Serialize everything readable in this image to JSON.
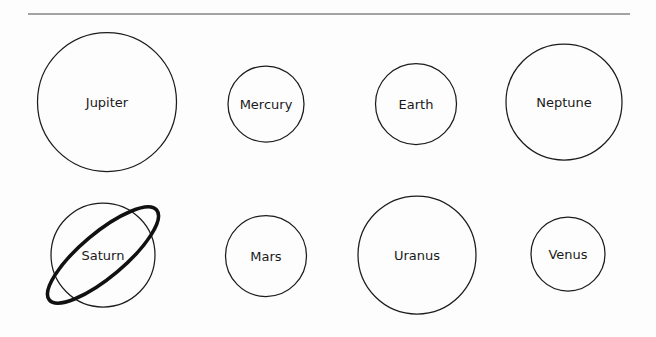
{
  "figure": {
    "title": "",
    "background_color": "#fdfdfd",
    "divider": {
      "name": "horizontal-rule",
      "x1": 28,
      "x2": 630,
      "y": 14,
      "color": "#848484",
      "thickness": 1.6
    },
    "stroke_color": "#1c1c1c",
    "label_color": "#1a1a1a",
    "ring_color": "#111111"
  },
  "chart_data": {
    "type": "scatter",
    "xlabel": "",
    "ylabel": "",
    "note": "Each planet is drawn as a circle whose diameter encodes relative size; Saturn additionally shows a ring.",
    "planets": [
      {
        "name": "Jupiter",
        "label": "Jupiter",
        "cx": 107,
        "cy": 102,
        "diameter": 139,
        "row": 1,
        "column": 1,
        "has_ring": false
      },
      {
        "name": "Mercury",
        "label": "Mercury",
        "cx": 266,
        "cy": 104,
        "diameter": 76,
        "row": 1,
        "column": 2,
        "has_ring": false
      },
      {
        "name": "Earth",
        "label": "Earth",
        "cx": 416,
        "cy": 104,
        "diameter": 81,
        "row": 1,
        "column": 3,
        "has_ring": false
      },
      {
        "name": "Neptune",
        "label": "Neptune",
        "cx": 564,
        "cy": 102,
        "diameter": 116,
        "row": 1,
        "column": 4,
        "has_ring": false
      },
      {
        "name": "Saturn",
        "label": "Saturn",
        "cx": 103,
        "cy": 255,
        "diameter": 104,
        "row": 2,
        "column": 1,
        "has_ring": true,
        "ring": {
          "rx": 70,
          "ry": 22,
          "rotation": -40
        }
      },
      {
        "name": "Mars",
        "label": "Mars",
        "cx": 266,
        "cy": 256,
        "diameter": 81,
        "row": 2,
        "column": 2,
        "has_ring": false
      },
      {
        "name": "Uranus",
        "label": "Uranus",
        "cx": 417,
        "cy": 255,
        "diameter": 118,
        "row": 2,
        "column": 3,
        "has_ring": false
      },
      {
        "name": "Venus",
        "label": "Venus",
        "cx": 568,
        "cy": 254,
        "diameter": 74,
        "row": 2,
        "column": 4,
        "has_ring": false
      }
    ]
  }
}
